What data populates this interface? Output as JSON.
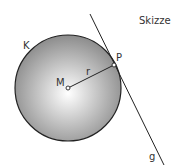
{
  "diagram": {
    "title": "Skizze",
    "circle_label": "K",
    "center_label": "M",
    "radius_label": "r",
    "point_label": "P",
    "tangent_label": "g",
    "colors": {
      "stroke": "#222222",
      "fill_center": "#ffffff",
      "fill_edge": "#8c8c8c",
      "text": "#333333"
    }
  }
}
